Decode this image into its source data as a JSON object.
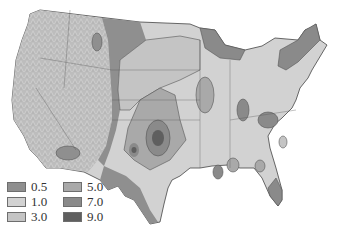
{
  "map": {
    "subject": "Contiguous United States",
    "style": "grayscale shaded-relief choropleth"
  },
  "legend": {
    "items": [
      {
        "label": "0.5",
        "color": "#8f8f8f"
      },
      {
        "label": "1.0",
        "color": "#d2d2d2"
      },
      {
        "label": "3.0",
        "color": "#c4c4c4"
      },
      {
        "label": "5.0",
        "color": "#a9a9a9"
      },
      {
        "label": "7.0",
        "color": "#8a8a8a"
      },
      {
        "label": "9.0",
        "color": "#5f5f5f"
      }
    ]
  }
}
